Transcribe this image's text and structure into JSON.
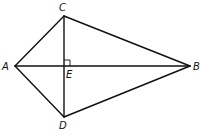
{
  "diagram": {
    "type": "kite",
    "vertices": [
      {
        "name": "A",
        "x": 15,
        "y": 66
      },
      {
        "name": "C",
        "x": 64,
        "y": 16
      },
      {
        "name": "B",
        "x": 190,
        "y": 66
      },
      {
        "name": "D",
        "x": 64,
        "y": 117
      },
      {
        "name": "E",
        "x": 64,
        "y": 66
      }
    ],
    "labels": {
      "A": "A",
      "B": "B",
      "C": "C",
      "D": "D",
      "E": "E"
    },
    "edges": [
      [
        "A",
        "C"
      ],
      [
        "C",
        "B"
      ],
      [
        "B",
        "D"
      ],
      [
        "D",
        "A"
      ],
      [
        "A",
        "B"
      ],
      [
        "C",
        "D"
      ]
    ],
    "right_angle_at": "E",
    "stroke_color": "#111111"
  }
}
